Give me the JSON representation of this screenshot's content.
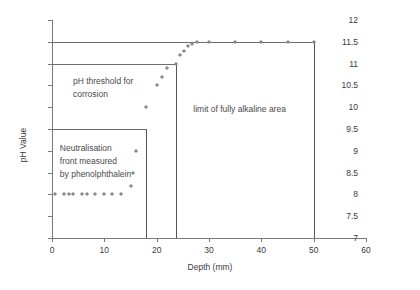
{
  "chart_data": {
    "type": "scatter",
    "title": "",
    "xlabel": "Depth (mm)",
    "ylabel": "pH Value",
    "xlim": [
      0,
      60
    ],
    "ylim": [
      7,
      12
    ],
    "xticks": [
      0,
      10,
      20,
      30,
      40,
      50,
      60
    ],
    "yticks": [
      7,
      7.5,
      8,
      8.5,
      9,
      9.5,
      10,
      10.5,
      11,
      11.5,
      12
    ],
    "grid": false,
    "legend": "none",
    "series": [
      {
        "name": "pH profile",
        "marker": "diamond",
        "color": "#8a8a8a",
        "points": [
          [
            0.6,
            8.0
          ],
          [
            2.3,
            8.0
          ],
          [
            3.2,
            8.0
          ],
          [
            4.0,
            8.0
          ],
          [
            5.8,
            8.0
          ],
          [
            6.6,
            8.0
          ],
          [
            8.3,
            8.0
          ],
          [
            9.9,
            8.0
          ],
          [
            11.5,
            8.0
          ],
          [
            13.2,
            8.0
          ],
          [
            15.0,
            8.2
          ],
          [
            15.4,
            8.5
          ],
          [
            16.1,
            9.0
          ],
          [
            18.0,
            10.0
          ],
          [
            20.0,
            10.5
          ],
          [
            21.0,
            10.7
          ],
          [
            22.0,
            10.9
          ],
          [
            23.7,
            11.0
          ],
          [
            24.5,
            11.2
          ],
          [
            25.3,
            11.3
          ],
          [
            26.0,
            11.4
          ],
          [
            26.8,
            11.45
          ],
          [
            27.8,
            11.5
          ],
          [
            30.0,
            11.5
          ],
          [
            35.0,
            11.5
          ],
          [
            40.0,
            11.5
          ],
          [
            45.0,
            11.5
          ],
          [
            50.0,
            11.5
          ]
        ]
      }
    ],
    "reference_lines": [
      {
        "name": "alkaline-plateau-line",
        "orientation": "horizontal",
        "y": 11.5,
        "x_from": 0,
        "x_to": 50
      },
      {
        "name": "ph-threshold-line",
        "orientation": "horizontal",
        "y": 11.0,
        "x_from": 0,
        "x_to": 23.7
      },
      {
        "name": "neutralisation-front-line",
        "orientation": "horizontal",
        "y": 9.5,
        "x_from": 0,
        "x_to": 18.0
      },
      {
        "name": "neutralisation-front-vline",
        "orientation": "vertical",
        "x": 18.0,
        "y_from": 7,
        "y_to": 9.5
      },
      {
        "name": "alkaline-limit-vline",
        "orientation": "vertical",
        "x": 23.7,
        "y_from": 7,
        "y_to": 11.0
      },
      {
        "name": "alkaline-plateau-vline",
        "orientation": "vertical",
        "x": 50.0,
        "y_from": 7,
        "y_to": 11.5
      }
    ],
    "annotations": [
      {
        "name": "ph-threshold-annotation",
        "text": "pH threshold for\ncorrosion",
        "x": 4.0,
        "y": 10.75
      },
      {
        "name": "neutralisation-annotation",
        "text": "Neutralisation\nfront measured\nby phenolphthalein",
        "x": 1.5,
        "y": 9.2
      },
      {
        "name": "alkaline-limit-annotation",
        "text": "limit of fully alkaline area",
        "x": 27.0,
        "y": 10.1
      }
    ]
  }
}
